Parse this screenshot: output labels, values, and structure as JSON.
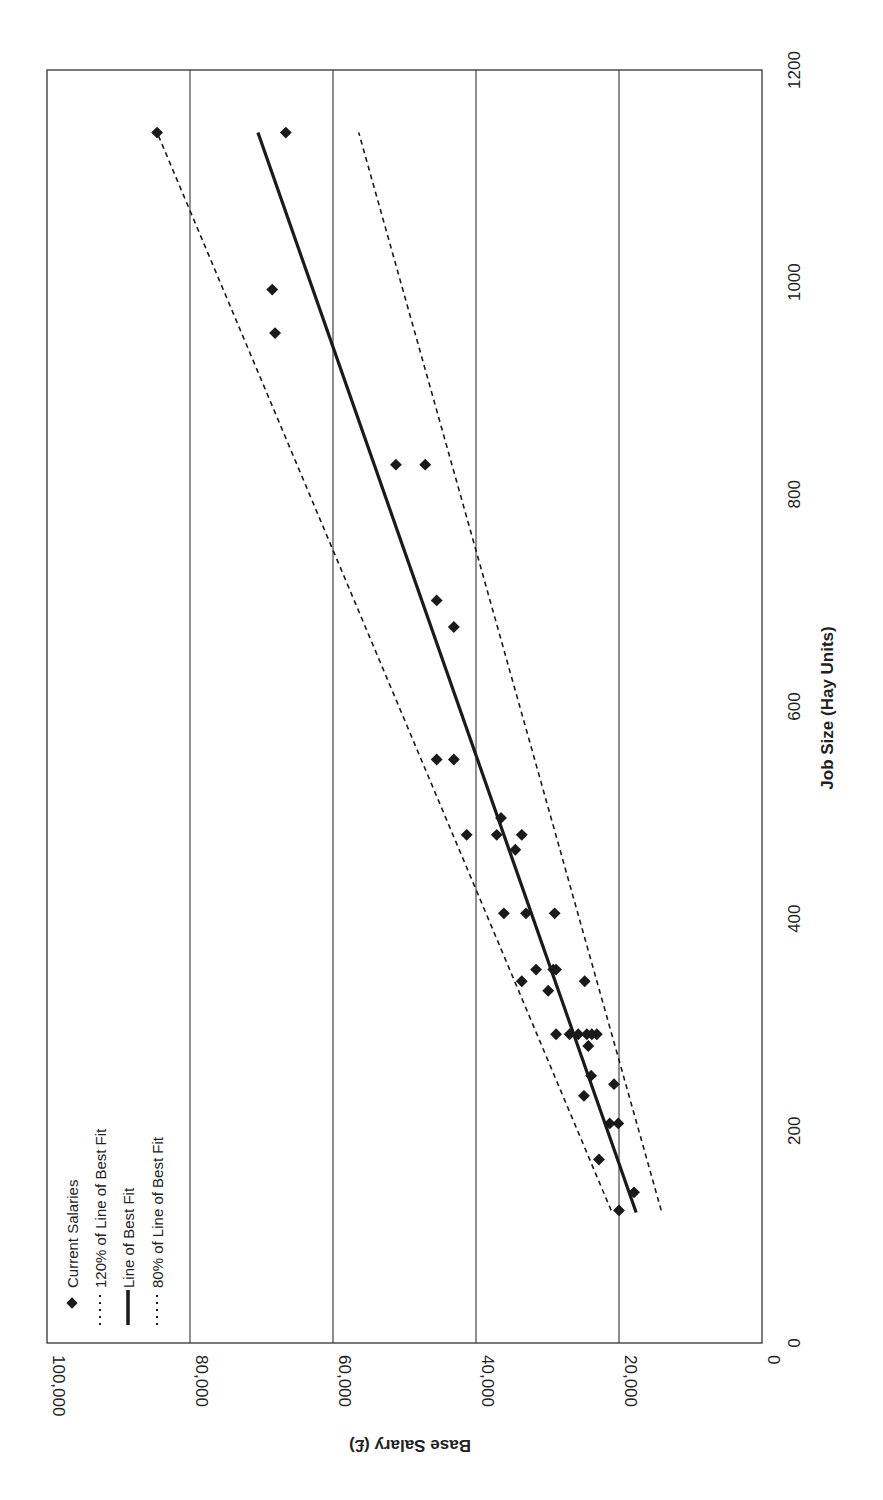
{
  "chart_data": {
    "type": "scatter",
    "title": "",
    "orientation_note": "figure rotated 90 degrees counterclockwise on page",
    "xlabel": "Job Size (Hay Units)",
    "ylabel": "Base Salary (£)",
    "xlim": [
      0,
      1200
    ],
    "ylim": [
      0,
      100000
    ],
    "x_ticks": [
      0,
      200,
      400,
      600,
      800,
      1000,
      1200
    ],
    "x_tick_labels": [
      "0",
      "200",
      "400",
      "600",
      "800",
      "1000",
      "1200"
    ],
    "y_ticks": [
      0,
      20000,
      40000,
      60000,
      80000,
      100000
    ],
    "y_tick_labels": [
      "0",
      "20,000",
      "40,000",
      "60,000",
      "80,000",
      "100,000"
    ],
    "grid": {
      "y_major": true,
      "x_major": false
    },
    "legend_position": "upper left (in chart frame)",
    "legend": [
      {
        "label": "Current Salaries",
        "style": "marker-diamond"
      },
      {
        "label": "120% of Line of Best Fit",
        "style": "dashed"
      },
      {
        "label": "Line of Best Fit",
        "style": "solid"
      },
      {
        "label": "80% of Line of Best Fit",
        "style": "dashed"
      }
    ],
    "series": [
      {
        "name": "Current Salaries",
        "type": "scatter",
        "points": [
          [
            125,
            20000
          ],
          [
            142,
            17900
          ],
          [
            173,
            22800
          ],
          [
            207,
            21300
          ],
          [
            207,
            20100
          ],
          [
            233,
            24900
          ],
          [
            244,
            20700
          ],
          [
            252,
            23900
          ],
          [
            280,
            24300
          ],
          [
            291,
            28800
          ],
          [
            291,
            26900
          ],
          [
            291,
            25700
          ],
          [
            291,
            24500
          ],
          [
            291,
            23800
          ],
          [
            291,
            23100
          ],
          [
            332,
            29900
          ],
          [
            341,
            33600
          ],
          [
            341,
            24800
          ],
          [
            352,
            31600
          ],
          [
            352,
            29200
          ],
          [
            352,
            28800
          ],
          [
            405,
            36100
          ],
          [
            405,
            33000
          ],
          [
            405,
            29000
          ],
          [
            465,
            34500
          ],
          [
            479,
            41300
          ],
          [
            479,
            37100
          ],
          [
            479,
            33600
          ],
          [
            495,
            36500
          ],
          [
            550,
            45500
          ],
          [
            550,
            43100
          ],
          [
            675,
            43100
          ],
          [
            700,
            45500
          ],
          [
            828,
            51200
          ],
          [
            828,
            47100
          ],
          [
            952,
            68100
          ],
          [
            993,
            68500
          ],
          [
            1141,
            84600
          ],
          [
            1141,
            66600
          ]
        ]
      },
      {
        "name": "120% of Line of Best Fit",
        "type": "line",
        "points": [
          [
            125,
            21100
          ],
          [
            1141,
            84600
          ]
        ]
      },
      {
        "name": "Line of Best Fit",
        "type": "line",
        "points": [
          [
            123,
            17600
          ],
          [
            1141,
            70500
          ]
        ]
      },
      {
        "name": "80% of Line of Best Fit",
        "type": "line",
        "points": [
          [
            125,
            14100
          ],
          [
            1141,
            56400
          ]
        ]
      }
    ]
  },
  "labels": {
    "y_axis_title": "Base Salary (£)",
    "x_axis_title": "Job Size (Hay Units)",
    "legend": [
      "Current Salaries",
      "120% of Line of Best Fit",
      "Line of Best Fit",
      "80% of Line of Best Fit"
    ],
    "salary_ticks": [
      "0",
      "20,000",
      "40,000",
      "60,000",
      "80,000",
      "100,000"
    ],
    "job_ticks": [
      "0",
      "200",
      "400",
      "600",
      "800",
      "1000",
      "1200"
    ]
  },
  "colors": {
    "ink": "#1a1a1a",
    "grid": "#333333",
    "background": "#ffffff"
  }
}
